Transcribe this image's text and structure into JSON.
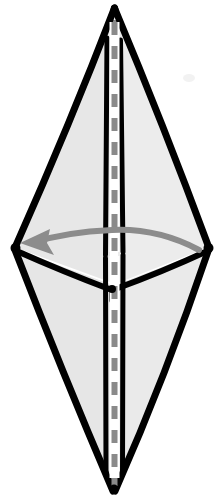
{
  "figure": {
    "description": "Hand-drawn style hexagonal bipyramid (elongated diamond) shown in perspective with a vertical dashed rotation axis and a curved arrow indicating rotation direction.",
    "canvas": {
      "width": 221,
      "height": 502,
      "background": "#ffffff"
    },
    "colors": {
      "face_fill": "#e6e6e6",
      "face_fill_light": "#efefef",
      "edge": "#000000",
      "axis_dash": "#8a8a8a",
      "arrow": "#8c8c8c",
      "background": "#ffffff",
      "speck": "#f2f2f2"
    },
    "geometry": {
      "top_apex": {
        "x": 114,
        "y": 8
      },
      "bottom_apex": {
        "x": 114,
        "y": 492
      },
      "left_vertex": {
        "x": 14,
        "y": 248
      },
      "right_vertex": {
        "x": 209,
        "y": 248
      },
      "front_vertex": {
        "x": 112,
        "y": 290
      },
      "axis_top": {
        "x": 114,
        "y": 20
      },
      "axis_bottom": {
        "x": 114,
        "y": 486
      }
    },
    "edges": [
      {
        "name": "top-apex-to-left-vertex",
        "from": "top_apex",
        "to": "left_vertex"
      },
      {
        "name": "top-apex-to-right-vertex",
        "from": "top_apex",
        "to": "right_vertex"
      },
      {
        "name": "bottom-apex-to-left-vertex",
        "from": "bottom_apex",
        "to": "left_vertex"
      },
      {
        "name": "bottom-apex-to-right-vertex",
        "from": "bottom_apex",
        "to": "right_vertex"
      },
      {
        "name": "left-vertex-to-front-vertex",
        "from": "left_vertex",
        "to": "front_vertex"
      },
      {
        "name": "right-vertex-to-front-vertex",
        "from": "right_vertex",
        "to": "front_vertex"
      },
      {
        "name": "front-vertex-to-bottom-apex",
        "from": "front_vertex",
        "to": "bottom_apex"
      },
      {
        "name": "front-edge-upper-left",
        "from": "top_apex",
        "to": "front_vertex"
      },
      {
        "name": "front-edge-upper-right",
        "from": "top_apex",
        "to": "front_vertex"
      }
    ],
    "axis": {
      "name": "rotation-axis",
      "style": "dashed",
      "orientation": "vertical",
      "stroke_width": 6,
      "dash_on": 13,
      "dash_off": 11
    },
    "arrow": {
      "name": "rotation-arrow",
      "direction": "leftward",
      "head_at": {
        "x": 22,
        "y": 242
      },
      "tail_at": {
        "x": 200,
        "y": 250
      },
      "style": "curved",
      "stroke_width": 6
    },
    "labels": []
  }
}
